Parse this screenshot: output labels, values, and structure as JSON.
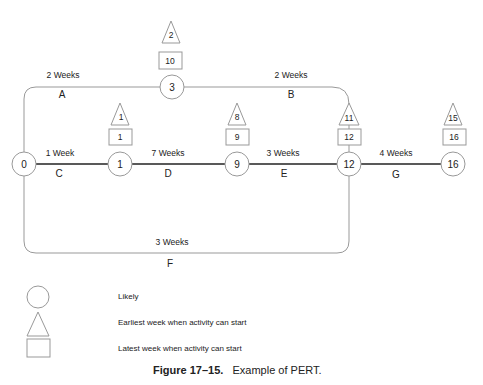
{
  "diagram": {
    "type": "PERT network",
    "nodes": [
      {
        "id": "n0",
        "label": "0",
        "x": 24,
        "y": 164
      },
      {
        "id": "n1",
        "label": "1",
        "x": 120,
        "y": 164,
        "earliest": "1",
        "latest": "1"
      },
      {
        "id": "n9",
        "label": "9",
        "x": 237,
        "y": 164,
        "earliest": "8",
        "latest": "9"
      },
      {
        "id": "n12",
        "label": "12",
        "x": 349,
        "y": 164,
        "earliest": "11",
        "latest": "12"
      },
      {
        "id": "n16",
        "label": "16",
        "x": 453,
        "y": 164,
        "earliest": "15",
        "latest": "16"
      },
      {
        "id": "n3",
        "label": "3",
        "x": 172,
        "y": 87,
        "earliest": "2",
        "latest": "10"
      }
    ],
    "activities": [
      {
        "name": "A",
        "duration": "2 Weeks",
        "from": "0",
        "to": "3"
      },
      {
        "name": "B",
        "duration": "2 Weeks",
        "from": "3",
        "to": "12"
      },
      {
        "name": "C",
        "duration": "1 Week",
        "from": "0",
        "to": "1"
      },
      {
        "name": "D",
        "duration": "7 Weeks",
        "from": "1",
        "to": "9"
      },
      {
        "name": "E",
        "duration": "3 Weeks",
        "from": "9",
        "to": "12"
      },
      {
        "name": "F",
        "duration": "3 Weeks",
        "from": "0",
        "to": "12"
      },
      {
        "name": "G",
        "duration": "4 Weeks",
        "from": "12",
        "to": "16"
      }
    ]
  },
  "legend": {
    "circle": "Likely",
    "triangle": "Earliest week when activity can start",
    "square": "Latest week when activity can start"
  },
  "caption": {
    "number": "Figure 17–15.",
    "text": "Example of PERT."
  }
}
